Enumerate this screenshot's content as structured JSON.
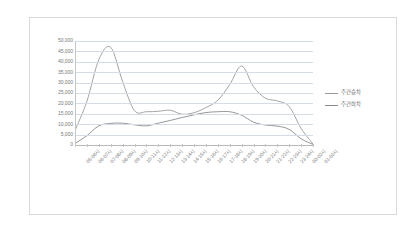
{
  "chart_data": {
    "type": "line",
    "title": "",
    "xlabel": "",
    "ylabel": "",
    "ylim": [
      0,
      50000
    ],
    "ytick_step": 5000,
    "grid": true,
    "legend_position": "right",
    "categories": [
      "05-06시",
      "06-07시",
      "07-08시",
      "08-09시",
      "09-10시",
      "10-11시",
      "11-12시",
      "12-13시",
      "13-14시",
      "14-15시",
      "15-16시",
      "16-17시",
      "17-18시",
      "18-19시",
      "19-20시",
      "20-21시",
      "21-22시",
      "22-23시",
      "23-24시",
      "00-02시",
      "01-02시"
    ],
    "ytick_labels": [
      "50,000",
      "45,000",
      "40,000",
      "35,000",
      "30,000",
      "25,000",
      "20,000",
      "15,000",
      "10,000",
      "5,000",
      "0"
    ],
    "series": [
      {
        "name": "주간승차",
        "color": "#9b9b9b",
        "values": [
          7000,
          21000,
          41000,
          47000,
          30500,
          16500,
          16000,
          16200,
          16700,
          14800,
          15500,
          18000,
          21500,
          29000,
          38000,
          28000,
          22500,
          21200,
          18500,
          8000,
          500
        ]
      },
      {
        "name": "주간하차",
        "color": "#8a8a8a",
        "values": [
          700,
          4500,
          9200,
          10400,
          10500,
          9700,
          9200,
          10500,
          11800,
          13200,
          14500,
          15600,
          16000,
          16000,
          14300,
          11000,
          9600,
          9100,
          7500,
          3000,
          300
        ]
      }
    ]
  },
  "legend": {
    "items": [
      {
        "label": "주간승차"
      },
      {
        "label": "주간하차"
      }
    ]
  }
}
